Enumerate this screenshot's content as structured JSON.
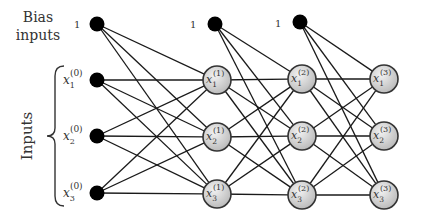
{
  "labels": {
    "bias_line1": "Bias",
    "bias_line2": "inputs",
    "inputs": "Inputs",
    "bias_value": "1"
  },
  "colors": {
    "edge": "#1a1a1a",
    "input_node": "#000000",
    "hidden_fill_light": "#f0f0f0",
    "hidden_fill_dark": "#bdbdbd",
    "hidden_stroke": "#333333"
  },
  "layers": [
    {
      "name": "input",
      "bias": {
        "x": 97,
        "y": 24,
        "label": "1",
        "label_x": 74,
        "label_y": 28
      },
      "nodes": [
        {
          "x": 97,
          "y": 80,
          "var": "x",
          "sub": "1",
          "sup": "(0)"
        },
        {
          "x": 97,
          "y": 136,
          "var": "x",
          "sub": "2",
          "sup": "(0)"
        },
        {
          "x": 97,
          "y": 193,
          "var": "x",
          "sub": "3",
          "sup": "(0)"
        }
      ]
    },
    {
      "name": "layer1",
      "bias": {
        "x": 215,
        "y": 24,
        "label": "1",
        "label_x": 190,
        "label_y": 28
      },
      "nodes": [
        {
          "x": 217,
          "y": 80,
          "var": "x",
          "sub": "1",
          "sup": "(1)"
        },
        {
          "x": 217,
          "y": 137,
          "var": "x",
          "sub": "2",
          "sup": "(1)"
        },
        {
          "x": 217,
          "y": 194,
          "var": "x",
          "sub": "3",
          "sup": "(1)"
        }
      ]
    },
    {
      "name": "layer2",
      "bias": {
        "x": 300,
        "y": 22,
        "label": "1",
        "label_x": 275,
        "label_y": 27
      },
      "nodes": [
        {
          "x": 302,
          "y": 79,
          "var": "x",
          "sub": "1",
          "sup": "(2)"
        },
        {
          "x": 302,
          "y": 136,
          "var": "x",
          "sub": "2",
          "sup": "(2)"
        },
        {
          "x": 302,
          "y": 195,
          "var": "x",
          "sub": "3",
          "sup": "(2)"
        }
      ]
    },
    {
      "name": "layer3",
      "bias": null,
      "nodes": [
        {
          "x": 384,
          "y": 79,
          "var": "x",
          "sub": "1",
          "sup": "(3)"
        },
        {
          "x": 384,
          "y": 136,
          "var": "x",
          "sub": "2",
          "sup": "(3)"
        },
        {
          "x": 384,
          "y": 195,
          "var": "x",
          "sub": "3",
          "sup": "(3)"
        }
      ]
    }
  ]
}
